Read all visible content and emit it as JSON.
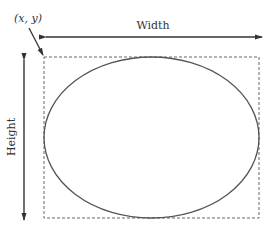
{
  "diagram": {
    "origin_label": "(x, y)",
    "width_label": "Width",
    "height_label": "Height",
    "colors": {
      "stroke": "#333333",
      "ellipse": "#555555",
      "dashed": "#666666",
      "background": "#ffffff"
    }
  }
}
